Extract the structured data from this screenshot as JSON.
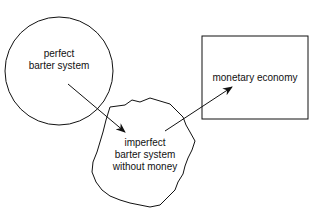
{
  "diagram": {
    "nodes": [
      {
        "id": "perfect",
        "shape": "circle",
        "lines": [
          "perfect",
          "barter system"
        ]
      },
      {
        "id": "imperfect",
        "shape": "irregular-blob",
        "lines": [
          "imperfect",
          "barter system",
          "without money"
        ]
      },
      {
        "id": "monetary",
        "shape": "rectangle",
        "lines": [
          "monetary economy"
        ]
      }
    ],
    "edges": [
      {
        "from": "perfect",
        "to": "imperfect",
        "style": "arrow"
      },
      {
        "from": "imperfect",
        "to": "monetary",
        "style": "arrow"
      }
    ],
    "stroke_color": "#111111",
    "background": "#ffffff"
  }
}
